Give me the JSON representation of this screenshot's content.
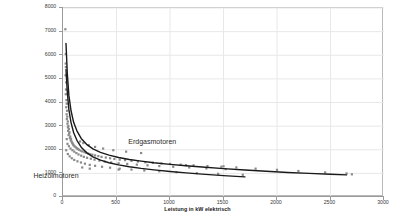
{
  "chart_data": {
    "type": "scatter",
    "title": "",
    "xlabel": "Leistung in kW elektrisch",
    "ylabel": "",
    "xlim": [
      0,
      3000
    ],
    "ylim": [
      0,
      8000
    ],
    "xticks": [
      0,
      500,
      1000,
      1500,
      2000,
      2500,
      3000
    ],
    "yticks": [
      0,
      1000,
      2000,
      3000,
      4000,
      5000,
      6000,
      7000,
      8000
    ],
    "grid": true,
    "legend_position": "inline-annotation",
    "annotations": [
      {
        "text": "Erdgasmotoren",
        "x": 620,
        "y": 2300
      },
      {
        "text": "Heizölmotoren",
        "x": 60,
        "y": 830
      }
    ],
    "series": [
      {
        "name": "Erdgasmotoren",
        "type": "trendline",
        "color": "#1a1a1a",
        "x": [
          28,
          40,
          55,
          75,
          100,
          130,
          170,
          220,
          280,
          350,
          430,
          520,
          620,
          730,
          850,
          1000,
          1150,
          1300,
          1500,
          1700,
          1900,
          2100,
          2300,
          2500,
          2650
        ],
        "y": [
          6500,
          5250,
          4300,
          3650,
          3150,
          2800,
          2480,
          2230,
          2040,
          1890,
          1770,
          1670,
          1590,
          1520,
          1450,
          1380,
          1320,
          1270,
          1200,
          1140,
          1090,
          1040,
          1000,
          960,
          935
        ]
      },
      {
        "name": "Heizölmotoren",
        "type": "trendline",
        "color": "#1a1a1a",
        "x": [
          28,
          40,
          55,
          75,
          100,
          130,
          170,
          220,
          280,
          350,
          430,
          520,
          620,
          730,
          850,
          1000,
          1150,
          1300,
          1500,
          1700
        ],
        "y": [
          5400,
          4450,
          3700,
          3150,
          2720,
          2400,
          2110,
          1880,
          1700,
          1560,
          1450,
          1360,
          1280,
          1210,
          1150,
          1080,
          1020,
          970,
          905,
          850
        ]
      },
      {
        "name": "Messpunkte",
        "type": "scatter",
        "color": "#8a8a8a",
        "points": [
          [
            22,
            7100
          ],
          [
            26,
            6050
          ],
          [
            25,
            5650
          ],
          [
            27,
            5500
          ],
          [
            24,
            5150
          ],
          [
            30,
            4850
          ],
          [
            28,
            4550
          ],
          [
            26,
            4350
          ],
          [
            32,
            4100
          ],
          [
            35,
            3950
          ],
          [
            30,
            3800
          ],
          [
            38,
            3650
          ],
          [
            34,
            3500
          ],
          [
            40,
            3400
          ],
          [
            36,
            3300
          ],
          [
            45,
            3200
          ],
          [
            42,
            3100
          ],
          [
            50,
            3000
          ],
          [
            46,
            2950
          ],
          [
            55,
            2880
          ],
          [
            48,
            2800
          ],
          [
            60,
            2740
          ],
          [
            58,
            2680
          ],
          [
            52,
            2620
          ],
          [
            68,
            2560
          ],
          [
            64,
            2500
          ],
          [
            75,
            2460
          ],
          [
            72,
            2400
          ],
          [
            80,
            2350
          ],
          [
            85,
            2300
          ],
          [
            90,
            2260
          ],
          [
            95,
            2220
          ],
          [
            100,
            2180
          ],
          [
            110,
            2140
          ],
          [
            120,
            2100
          ],
          [
            130,
            2060
          ],
          [
            140,
            2030
          ],
          [
            150,
            2000
          ],
          [
            165,
            1960
          ],
          [
            180,
            1930
          ],
          [
            200,
            1900
          ],
          [
            215,
            1870
          ],
          [
            235,
            1840
          ],
          [
            255,
            1810
          ],
          [
            275,
            1790
          ],
          [
            300,
            1760
          ],
          [
            330,
            1730
          ],
          [
            360,
            1700
          ],
          [
            400,
            1670
          ],
          [
            440,
            1640
          ],
          [
            480,
            1610
          ],
          [
            530,
            1580
          ],
          [
            580,
            1560
          ],
          [
            640,
            1530
          ],
          [
            700,
            1500
          ],
          [
            770,
            1470
          ],
          [
            840,
            1450
          ],
          [
            920,
            1420
          ],
          [
            1000,
            1400
          ],
          [
            1100,
            1370
          ],
          [
            1220,
            1340
          ],
          [
            1350,
            1310
          ],
          [
            1480,
            1280
          ],
          [
            1620,
            1250
          ],
          [
            1800,
            1200
          ],
          [
            2000,
            1150
          ],
          [
            2200,
            1100
          ],
          [
            2450,
            1040
          ],
          [
            2650,
            1000
          ],
          [
            2700,
            960
          ],
          [
            35,
            2450
          ],
          [
            42,
            2250
          ],
          [
            55,
            2150
          ],
          [
            70,
            2050
          ],
          [
            88,
            1980
          ],
          [
            105,
            1920
          ],
          [
            125,
            1860
          ],
          [
            145,
            1800
          ],
          [
            170,
            1750
          ],
          [
            195,
            1700
          ],
          [
            225,
            1660
          ],
          [
            260,
            1620
          ],
          [
            295,
            1580
          ],
          [
            340,
            1540
          ],
          [
            390,
            1500
          ],
          [
            450,
            1460
          ],
          [
            520,
            1430
          ],
          [
            600,
            1400
          ],
          [
            690,
            1370
          ],
          [
            790,
            1340
          ],
          [
            900,
            1310
          ],
          [
            1030,
            1280
          ],
          [
            1180,
            1250
          ],
          [
            1340,
            1210
          ],
          [
            1520,
            1180
          ],
          [
            30,
            1980
          ],
          [
            45,
            1820
          ],
          [
            62,
            1720
          ],
          [
            82,
            1640
          ],
          [
            105,
            1570
          ],
          [
            135,
            1510
          ],
          [
            168,
            1460
          ],
          [
            205,
            1410
          ],
          [
            250,
            1360
          ],
          [
            300,
            1320
          ],
          [
            365,
            1280
          ],
          [
            440,
            1240
          ],
          [
            530,
            1200
          ],
          [
            640,
            1160
          ],
          [
            760,
            1120
          ],
          [
            900,
            1090
          ],
          [
            1060,
            1050
          ],
          [
            1250,
            1010
          ],
          [
            1450,
            980
          ],
          [
            1680,
            940
          ],
          [
            160,
            2350
          ],
          [
            190,
            2280
          ],
          [
            240,
            2200
          ],
          [
            300,
            2120
          ],
          [
            375,
            2050
          ],
          [
            470,
            1980
          ],
          [
            590,
            1920
          ],
          [
            730,
            1860
          ],
          [
            180,
            1250
          ],
          [
            250,
            1200
          ],
          [
            520,
            1160
          ],
          [
            1150,
            1350
          ],
          [
            1500,
            1300
          ]
        ]
      }
    ]
  },
  "axis": {
    "y_tick_labels": [
      "8000",
      "7000",
      "6000",
      "5000",
      "4000",
      "3000",
      "2000",
      "1000",
      "0"
    ],
    "x_tick_labels": [
      "0",
      "500",
      "1000",
      "1500",
      "2000",
      "2500",
      "3000"
    ],
    "x_title": "Leistung in kW elektrisch"
  },
  "labels": {
    "erdgas": "Erdgasmotoren",
    "heizoel": "Heizölmotoren"
  },
  "colors": {
    "curve": "#1a1a1a",
    "marker": "#8a8a8a",
    "grid": "#e8e8e8",
    "axis": "#9a9a9a",
    "frame": "#b9b9b9"
  }
}
